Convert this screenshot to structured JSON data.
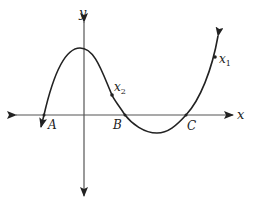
{
  "diagram": {
    "axes": {
      "x_label": "x",
      "y_label": "y"
    },
    "intercepts": [
      {
        "id": "A",
        "label": "A"
      },
      {
        "id": "B",
        "label": "B"
      },
      {
        "id": "C",
        "label": "C"
      }
    ],
    "points": [
      {
        "id": "x1",
        "base": "x",
        "sub": "1"
      },
      {
        "id": "x2",
        "base": "x",
        "sub": "2"
      }
    ],
    "colors": {
      "axis": "#555555",
      "curve": "#222222",
      "text": "#222222"
    }
  }
}
